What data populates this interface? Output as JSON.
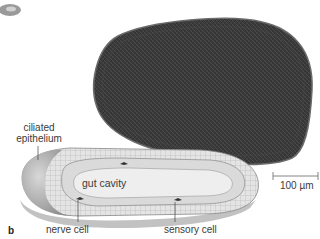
{
  "figure": {
    "panel_letter": "b",
    "scale_bar": {
      "label": "100 µm"
    },
    "labels": {
      "ciliated_epithelium_line1": "ciliated",
      "ciliated_epithelium_line2": "epithelium",
      "gut_cavity": "gut cavity",
      "nerve_cell": "nerve cell",
      "sensory_cell": "sensory cell"
    },
    "colors": {
      "micrograph_fill": "#3c3c3c",
      "micrograph_edge": "#6a6a6a",
      "diagram_outer": "#bdbdbd",
      "diagram_inner": "#e6e6e6",
      "gut_cavity_fill": "#eeeeee",
      "text": "#3a3a3a"
    }
  }
}
